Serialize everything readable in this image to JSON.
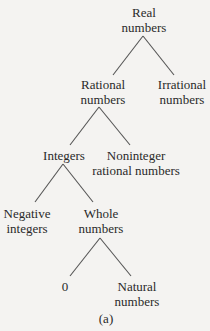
{
  "diagram": {
    "type": "tree",
    "caption": "(a)",
    "nodes": {
      "real": {
        "line1": "Real",
        "line2": "numbers"
      },
      "rational": {
        "line1": "Rational",
        "line2": "numbers"
      },
      "irrational": {
        "line1": "Irrational",
        "line2": "numbers"
      },
      "integers": {
        "line1": "Integers"
      },
      "noninteger": {
        "line1": "Noninteger",
        "line2": "rational numbers"
      },
      "negative": {
        "line1": "Negative",
        "line2": "integers"
      },
      "whole": {
        "line1": "Whole",
        "line2": "numbers"
      },
      "zero": {
        "line1": "0"
      },
      "natural": {
        "line1": "Natural",
        "line2": "numbers"
      }
    },
    "edges": [
      [
        "Real numbers",
        "Rational numbers"
      ],
      [
        "Real numbers",
        "Irrational numbers"
      ],
      [
        "Rational numbers",
        "Integers"
      ],
      [
        "Rational numbers",
        "Noninteger rational numbers"
      ],
      [
        "Integers",
        "Negative integers"
      ],
      [
        "Integers",
        "Whole numbers"
      ],
      [
        "Whole numbers",
        "0"
      ],
      [
        "Whole numbers",
        "Natural numbers"
      ]
    ],
    "colors": {
      "background": "#f4f3f1",
      "text": "#2a2a2a",
      "line": "#555555"
    }
  }
}
